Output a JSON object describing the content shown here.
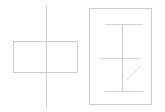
{
  "canvas": {
    "width": 165,
    "height": 112,
    "background_color": "#ffffff",
    "title": "Two-figure line sketch"
  },
  "style": {
    "line_color": "#cccccc",
    "line_color_faint": "#dcdcdc",
    "line_color_soft": "#d4d4d4",
    "stroke_width": 1,
    "stroke_width_thin": 0.9
  },
  "figures": [
    {
      "id": "figure-left",
      "name": "rectangle-with-vertical-axis",
      "label": "",
      "parts": [
        {
          "name": "horizontal-rectangle",
          "type": "rect",
          "x": 13,
          "y": 41,
          "width": 65,
          "height": 32,
          "color": "#cccccc"
        },
        {
          "name": "vertical-axis-line",
          "type": "line",
          "x1": 46,
          "y1": 5,
          "x2": 46,
          "y2": 108,
          "color": "#d0d0d0"
        }
      ]
    },
    {
      "id": "figure-right",
      "name": "framed-i-beam-with-diagonal-tick",
      "label": "",
      "parts": [
        {
          "name": "outer-frame-rectangle",
          "type": "rect",
          "x": 89,
          "y": 8,
          "width": 63,
          "height": 97,
          "color": "#cccccc"
        },
        {
          "name": "central-vertical-line",
          "type": "line",
          "x1": 122,
          "y1": 24,
          "x2": 122,
          "y2": 91,
          "color": "#c8c8c8"
        },
        {
          "name": "top-crossbar",
          "type": "line",
          "x1": 105,
          "y1": 24,
          "x2": 143,
          "y2": 24,
          "color": "#d4d4d4"
        },
        {
          "name": "middle-crossbar",
          "type": "line",
          "x1": 100,
          "y1": 58,
          "x2": 140,
          "y2": 58,
          "color": "#d4d4d4"
        },
        {
          "name": "bottom-crossbar",
          "type": "line",
          "x1": 105,
          "y1": 91,
          "x2": 143,
          "y2": 91,
          "color": "#d4d4d4"
        },
        {
          "name": "diagonal-tick-line",
          "type": "line",
          "x1": 127,
          "y1": 80,
          "x2": 141,
          "y2": 66,
          "color": "#d6d6d6"
        }
      ]
    }
  ]
}
